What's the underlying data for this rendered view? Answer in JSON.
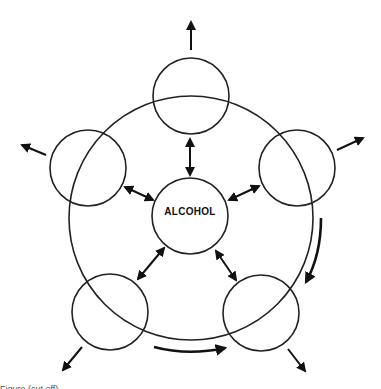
{
  "diagram": {
    "center_label": "ALCOHOL",
    "outer_circles": [
      {
        "position": "top",
        "label": ""
      },
      {
        "position": "left",
        "label": ""
      },
      {
        "position": "right",
        "label": ""
      },
      {
        "position": "bottom-left",
        "label": ""
      },
      {
        "position": "bottom-right",
        "label": ""
      }
    ],
    "ring": "large circle enclosing center",
    "arrows": {
      "bidirectional": 5,
      "outward": 5,
      "curved_flow": 2
    },
    "caption": "Figure (cut off)"
  }
}
